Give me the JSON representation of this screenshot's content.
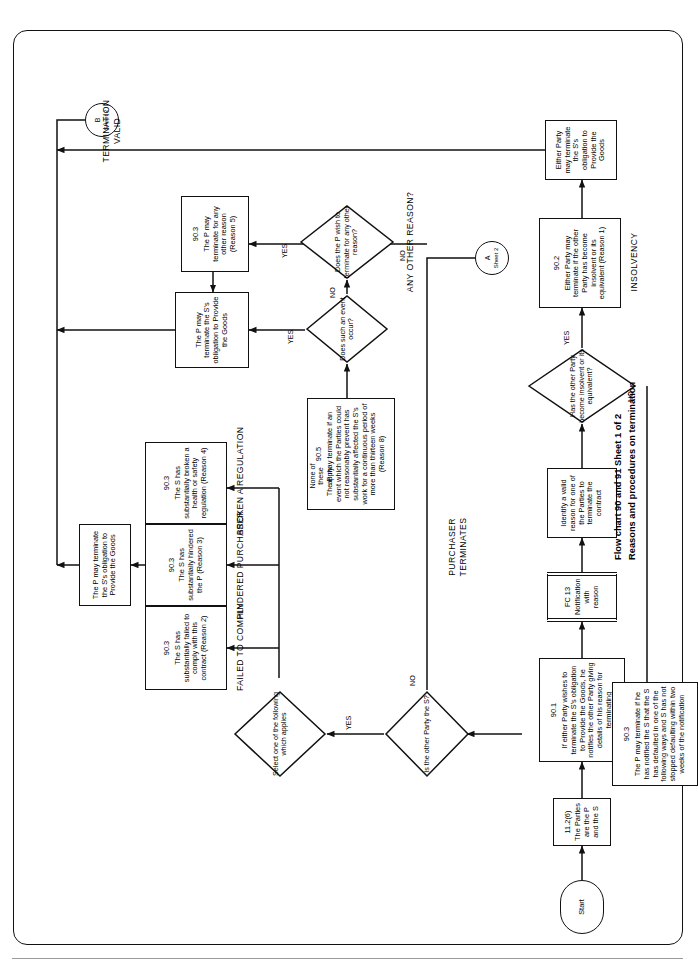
{
  "caption": {
    "line1": "Flow chart 90 and 91   Sheet 1 of 2",
    "line2": "Reasons and procedures on termination"
  },
  "nodes": {
    "start": {
      "ref": "",
      "text": "Start"
    },
    "parties": {
      "ref": "11.2(6)",
      "text": "The Parties are the P and the S"
    },
    "wishes": {
      "ref": "90.1",
      "text": "If either Party wishes to terminate the S's obligation to Provide the Goods, he notifies the other Party giving details of his reason for terminating"
    },
    "fc13": {
      "ref": "FC 13",
      "text": "Notification with reason"
    },
    "identify": {
      "ref": "",
      "text": "Identify a valid reason for one of the Parties to terminate the contract"
    },
    "insolvency": {
      "ref": "90.2",
      "text": "Either Party may terminate if the other Party has become insolvent or its equivalent (Reason 1)"
    },
    "either_party": {
      "ref": "",
      "text": "Either Party may terminate the S's obligation to Provide the Goods"
    },
    "p_may_term": {
      "ref": "",
      "text": "The P may terminate the S's obligation to Provide the Goods"
    },
    "failed": {
      "ref": "90.3",
      "text": "The S has substantially failed to comply with this contract (Reason 2)"
    },
    "hindered": {
      "ref": "90.3",
      "text": "The S has substantially hindered the P (Reason 3)"
    },
    "regulation": {
      "ref": "90.3",
      "text": "The S has substantially broken a health or safety regulation (Reason 4)"
    },
    "event": {
      "ref": "90.5",
      "text": "The P may terminate if an event which the Parties could not reasonably prevent has substantially affected the S's work for a continuous period of more than thirteen weeks (Reason 8)"
    },
    "p_term_s_obl": {
      "ref": "",
      "text": "The P may terminate the S's obligation to Provide the Goods"
    },
    "any_reason": {
      "ref": "90.3",
      "text": "The P may terminate for any other reason (Reason 5)"
    },
    "notified": {
      "ref": "90.3",
      "text": "The P may terminate if he has notified the S that the S has defaulted in one of the following ways and S has not stopped defaulting within two weeks of the notification"
    }
  },
  "decisions": {
    "other_party_s": "Is the other\nParty the S?",
    "insolvent": "Has the\nother Party\nbecome\ninsolvent or its\nequivalent?",
    "select_one": "Select\none of the\nfollowing which\napplies",
    "event_occur": "Does\nsuch an event\noccur?",
    "wish_other": "Does\nthe P wish to\nterminate for any other\nreason?"
  },
  "connectors": {
    "a": {
      "letter": "A",
      "sheet": "Sheet 2"
    },
    "b": {
      "letter": "B",
      "sheet": "Sheet 2"
    }
  },
  "branch_labels": {
    "yes": "YES",
    "no": "NO",
    "none_of_these": "None of\nthese\napply"
  },
  "section_labels": {
    "insolvency": "INSOLVENCY",
    "failed_to_comply": "FAILED TO COMPLY",
    "hindered_purchaser": "HINDERED PURCHASER",
    "broken_regulation": "BROKEN A REGULATION",
    "any_other_reason": "ANY OTHER REASON?",
    "purchaser_terminates": "PURCHASER\nTERMINATES",
    "termination_valid": "TERMINATION\nVALID"
  },
  "colors": {
    "line": "#111111",
    "paper": "#ffffff",
    "rule": "#9a9a9a"
  }
}
